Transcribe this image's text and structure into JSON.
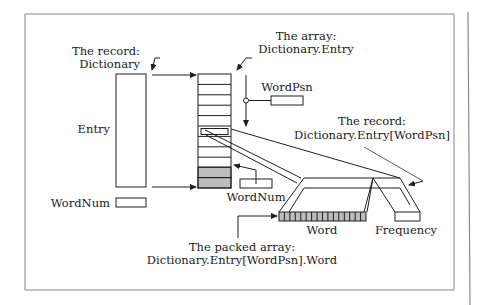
{
  "diagram": {
    "labels": {
      "record_dictionary_line1": "The record:",
      "record_dictionary_line2": "Dictionary",
      "array_entry_line1": "The array:",
      "array_entry_line2": "Dictionary.Entry",
      "word_psn": "WordPsn",
      "record_entry_line1": "The record:",
      "record_entry_line2": "Dictionary.Entry[WordPsn]",
      "entry": "Entry",
      "word_num_left": "WordNum",
      "word_num_right": "WordNum",
      "word": "Word",
      "frequency": "Frequency",
      "packed_array_line1": "The packed array:",
      "packed_array_line2": "Dictionary.Entry[WordPsn].Word"
    },
    "array_rows": 11,
    "array_selected_row": 5,
    "array_gray_rows": [
      9,
      10
    ],
    "packed_cells": 16,
    "colors": {
      "stroke": "#1f1f1f",
      "gray_fill": "#bdbdbd",
      "frame": "#9a9a9a"
    }
  }
}
